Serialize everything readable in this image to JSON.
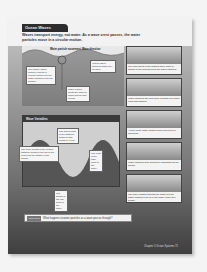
{
  "page": {
    "section_title": "Ocean Waves",
    "intro": "Waves transport energy, not water. As a wave crest passes, the water particles move in a circular motion.",
    "labels": {
      "wave_direction": "Wave direction",
      "water_particle_movement": "Water particle movement"
    },
    "notes": [
      "The floater (water particle) moves in circular motion like the water particles near the surface.",
      "Waves affect particles down only so deep.",
      "Make a wave depth the point at which waves lose energy."
    ],
    "panels": [
      "The movement of the floating toner mark is similar to the movement of the water particles.",
      "Water particles rise and move forward as a wave crest approaches.",
      "As the crest, water particles have moved to a maximum.",
      "Water particles drop and move backward as the trough.",
      "The wave passes through the water but the water particles end up in the same place they began."
    ],
    "wave_box": {
      "title": "Wave Variables",
      "wavelength": "The wavelength is the distance between two crests in a row.",
      "wave_height": "The wave height is the vertical distance between the top of the crest and the bottom of the trough.",
      "crest": "The crest is the high point of the wave.",
      "trough": "The trough is the low point of the wave."
    },
    "question": {
      "badge": "Visual Check",
      "text": "What happens to water particles as a wave passes through?"
    },
    "footer": "Chapter 5 Ocean Systems 75"
  }
}
